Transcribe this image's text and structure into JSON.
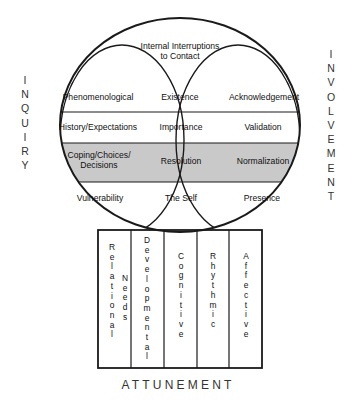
{
  "diagram": {
    "side_labels": {
      "left": "INQUIRY",
      "right": "INVOLVEMENT"
    },
    "bottom_label": "ATTUNEMENT",
    "top_lens": {
      "line1": "Internal Interruptions",
      "line2": "to Contact"
    },
    "rows": [
      {
        "id": "row-1",
        "shaded": false,
        "cells": [
          "Phenomenological",
          "Existence",
          "Acknowledgement"
        ]
      },
      {
        "id": "row-2",
        "shaded": false,
        "cells": [
          "History/Expectations",
          "Importance",
          "Validation"
        ]
      },
      {
        "id": "row-3",
        "shaded": true,
        "cells": [
          "Coping/Choices/\nDecisions",
          "Resolution",
          "Normalization"
        ]
      },
      {
        "id": "row-4",
        "shaded": false,
        "cells": [
          "Vulnerability",
          "The Self",
          "Presence"
        ]
      }
    ],
    "row3_cell1_lines": [
      "Coping/Choices/",
      "Decisions"
    ],
    "base_columns": [
      {
        "id": "col-relational-needs",
        "words": [
          "Relational",
          "Needs"
        ]
      },
      {
        "id": "col-developmental",
        "words": [
          "Developmental"
        ]
      },
      {
        "id": "col-cognitive",
        "words": [
          "Cognitive"
        ]
      },
      {
        "id": "col-rhythmic",
        "words": [
          "Rhythmic"
        ]
      },
      {
        "id": "col-affective",
        "words": [
          "Affective"
        ]
      }
    ],
    "colors": {
      "stroke": "#1a1a1a",
      "shaded_band": "#c9c9c9",
      "background": "#ffffff",
      "text": "#111111"
    }
  }
}
